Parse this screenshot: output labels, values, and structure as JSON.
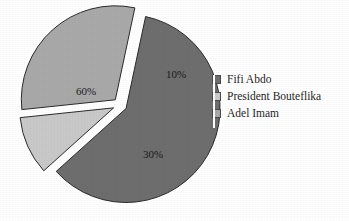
{
  "chart_data": {
    "type": "pie",
    "title": "",
    "exploded": true,
    "background_color": "#ffffff",
    "categories": [
      "Fifi Abdo",
      "President Bouteflika",
      "Adel Imam"
    ],
    "values": [
      60,
      10,
      30
    ],
    "value_labels": [
      "60%",
      "10%",
      "30%"
    ],
    "colors": [
      "#6e6e6e",
      "#c9c9c9",
      "#a9a9a9"
    ],
    "slice_border_color": "#2b2b2b",
    "label_color": "#1a1a1a",
    "legend_position": "right",
    "legend_entries": [
      {
        "label": "Fifi Abdo",
        "color": "#6e6e6e"
      },
      {
        "label": "President Bouteflika",
        "color": "#c9c9c9"
      },
      {
        "label": "Adel Imam",
        "color": "#a9a9a9"
      }
    ],
    "slices": [
      {
        "name": "Fifi Abdo",
        "value": 60,
        "label": "60%",
        "color": "#6e6e6e",
        "start_angle_deg": 12,
        "end_angle_deg": 228,
        "label_x": 86,
        "label_y": 92
      },
      {
        "name": "President Bouteflika",
        "value": 10,
        "label": "10%",
        "color": "#c9c9c9",
        "start_angle_deg": 228,
        "end_angle_deg": 264,
        "label_x": 176,
        "label_y": 75
      },
      {
        "name": "Adel Imam",
        "value": 30,
        "label": "30%",
        "color": "#a9a9a9",
        "start_angle_deg": 264,
        "end_angle_deg": 372,
        "label_x": 153,
        "label_y": 155
      }
    ],
    "geometry": {
      "center_x": 120,
      "center_y": 105,
      "radius": 94,
      "explode_offset": 7
    }
  }
}
